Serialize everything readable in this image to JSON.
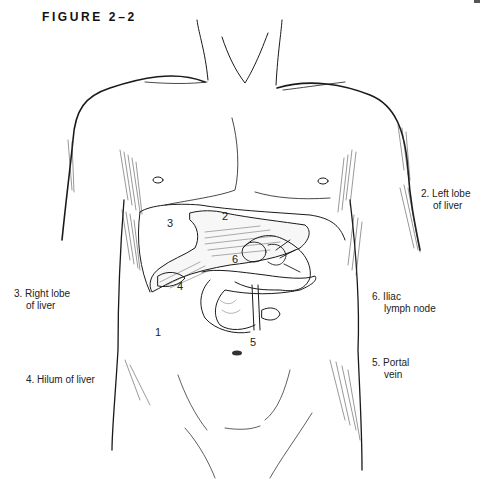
{
  "figure": {
    "title": "FIGURE 2–2"
  },
  "legend": [
    {
      "id": "2",
      "line1": "2. Left lobe",
      "line2": "of liver"
    },
    {
      "id": "3",
      "line1": "3. Right lobe",
      "line2": "of liver"
    },
    {
      "id": "6",
      "line1": "6. Iliac",
      "line2": "lymph node"
    },
    {
      "id": "4",
      "line1": "4. Hilum of liver",
      "line2": ""
    },
    {
      "id": "5",
      "line1": "5. Portal",
      "line2": "vein"
    }
  ],
  "markers": [
    {
      "text": "3"
    },
    {
      "text": "2"
    },
    {
      "text": "6"
    },
    {
      "text": "4"
    },
    {
      "text": "1"
    },
    {
      "text": "5"
    }
  ],
  "colors": {
    "ink": "#1a1a1a",
    "background": "#ffffff"
  }
}
